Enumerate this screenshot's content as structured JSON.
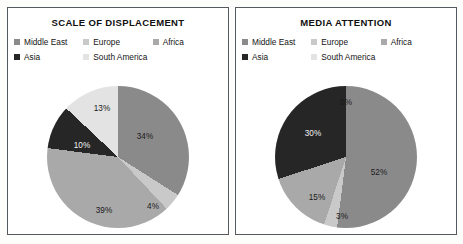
{
  "figure": {
    "background_color": "#fdfdfc",
    "panel_border_color": "#555a5e"
  },
  "series_colors": {
    "middle_east": "#8a8a8a",
    "europe": "#c9c9c9",
    "africa": "#a9a9a9",
    "asia": "#262626",
    "south_america": "#e3e3e3"
  },
  "legend": {
    "items": [
      {
        "label": "Middle East",
        "color": "#8a8a8a",
        "swatch_name": "legend-swatch-middle-east"
      },
      {
        "label": "Europe",
        "color": "#c9c9c9",
        "swatch_name": "legend-swatch-europe"
      },
      {
        "label": "Africa",
        "color": "#a9a9a9",
        "swatch_name": "legend-swatch-africa"
      },
      {
        "label": "Asia",
        "color": "#262626",
        "swatch_name": "legend-swatch-asia"
      },
      {
        "label": "South America",
        "color": "#e3e3e3",
        "swatch_name": "legend-swatch-south-america"
      }
    ]
  },
  "panels": [
    {
      "id": "scale-of-displacement",
      "title": "SCALE OF DISPLACEMENT"
    },
    {
      "id": "media-attention",
      "title": "MEDIA ATTENTION"
    }
  ],
  "chart_data": [
    {
      "type": "pie",
      "title": "SCALE OF DISPLACEMENT",
      "xlabel": "",
      "ylabel": "",
      "units": "percent",
      "start_angle_deg": 0,
      "direction": "clockwise",
      "legend_position": "top",
      "grid": false,
      "categories": [
        "Middle East",
        "Europe",
        "Africa",
        "Asia",
        "South America"
      ],
      "values": [
        34,
        4,
        39,
        10,
        13
      ],
      "labels": [
        "34%",
        "4%",
        "39%",
        "10%",
        "13%"
      ],
      "colors": [
        "#8a8a8a",
        "#c9c9c9",
        "#a9a9a9",
        "#262626",
        "#e3e3e3"
      ],
      "label_positions": [
        {
          "text": "34%",
          "x": 98,
          "y": 50,
          "dark_background": false
        },
        {
          "text": "4%",
          "x": 106,
          "y": 120,
          "dark_background": false
        },
        {
          "text": "39%",
          "x": 57,
          "y": 124,
          "dark_background": false
        },
        {
          "text": "10%",
          "x": 35,
          "y": 59,
          "dark_background": true
        },
        {
          "text": "13%",
          "x": 55,
          "y": 22,
          "dark_background": false
        }
      ]
    },
    {
      "type": "pie",
      "title": "MEDIA ATTENTION",
      "xlabel": "",
      "ylabel": "",
      "units": "percent",
      "start_angle_deg": 0,
      "direction": "clockwise",
      "legend_position": "top",
      "grid": false,
      "categories": [
        "Middle East",
        "Europe",
        "Africa",
        "Asia",
        "South America"
      ],
      "values": [
        52,
        3,
        15,
        30,
        0
      ],
      "labels": [
        "52%",
        "3%",
        "15%",
        "30%",
        "0%"
      ],
      "colors": [
        "#8a8a8a",
        "#c9c9c9",
        "#a9a9a9",
        "#262626",
        "#e3e3e3"
      ],
      "label_positions": [
        {
          "text": "52%",
          "x": 104,
          "y": 86,
          "dark_background": false
        },
        {
          "text": "3%",
          "x": 67,
          "y": 130,
          "dark_background": false
        },
        {
          "text": "15%",
          "x": 42,
          "y": 111,
          "dark_background": false
        },
        {
          "text": "30%",
          "x": 38,
          "y": 47,
          "dark_background": true
        },
        {
          "text": "0%",
          "x": 71,
          "y": 16,
          "dark_background": false
        }
      ]
    }
  ]
}
